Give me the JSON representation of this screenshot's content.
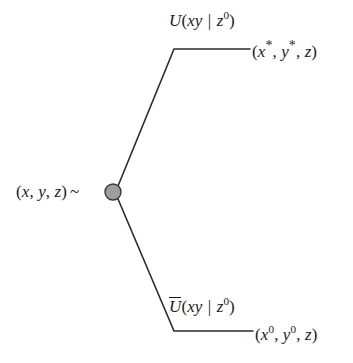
{
  "diagram": {
    "type": "branching-evolution-diagram",
    "background_color": "#ffffff",
    "line_color": "#2b2b2b",
    "node": {
      "name": "source-state-node",
      "fill_color": "#9e9e9e",
      "stroke_color": "#3a3a3a",
      "center_x": 113,
      "center_y": 192,
      "radius": 8
    },
    "labels": {
      "source": {
        "full_text": "(x, y, z) ~",
        "open_paren": "(",
        "x": "x",
        "comma1": ", ",
        "y": "y",
        "comma2": ", ",
        "z": "z",
        "close_paren": ")",
        "tilde": "~"
      },
      "upper_operator": {
        "full_text": "U(xy | z0)",
        "operator": "U",
        "open_paren": "(",
        "args": "xy",
        "bar": " | ",
        "condition": "z",
        "condition_sup": "0",
        "close_paren": ")"
      },
      "upper_state": {
        "full_text": "(x*, y*, z)",
        "open_paren": "(",
        "x": "x",
        "x_sup": "*",
        "comma1": ", ",
        "y": "y",
        "y_sup": "*",
        "comma2": ", ",
        "z": "z",
        "close_paren": ")"
      },
      "lower_operator": {
        "full_text": "Ū(xy | z0)",
        "operator": "U",
        "open_paren": "(",
        "args": "xy",
        "bar": " | ",
        "condition": "z",
        "condition_sup": "0",
        "close_paren": ")"
      },
      "lower_state": {
        "full_text": "(x0, y0, z)",
        "open_paren": "(",
        "x": "x",
        "x_sup": "0",
        "comma1": ", ",
        "y": "y",
        "y_sup": "0",
        "comma2": ", ",
        "z": "z",
        "close_paren": ")"
      }
    },
    "branches": [
      {
        "name": "upper-branch",
        "from_x": 118,
        "from_y": 186,
        "bend_x": 174,
        "bend_y": 49,
        "to_x": 250,
        "to_y": 49
      },
      {
        "name": "lower-branch",
        "from_x": 118,
        "from_y": 199,
        "bend_x": 174,
        "bend_y": 331,
        "to_x": 253,
        "to_y": 331
      }
    ]
  }
}
